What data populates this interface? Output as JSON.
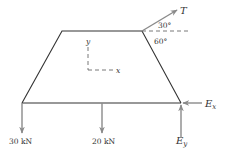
{
  "diagram": {
    "type": "free-body-diagram",
    "body_shape": "trapezoid",
    "colors": {
      "body_line": "#333333",
      "force_arrow": "#8a8a8a",
      "text": "#333333",
      "dashed": "#555555"
    },
    "forces": {
      "tension": {
        "label": "T",
        "angle_label_top": "30°",
        "angle_label_bottom": "60°"
      },
      "load_left": {
        "label": "30 kN"
      },
      "load_mid": {
        "label": "20 kN"
      },
      "reaction_x": {
        "label_main": "E",
        "label_sub": "x"
      },
      "reaction_y": {
        "label_main": "E",
        "label_sub": "y"
      }
    },
    "axes": {
      "x_label": "x",
      "y_label": "y"
    }
  }
}
